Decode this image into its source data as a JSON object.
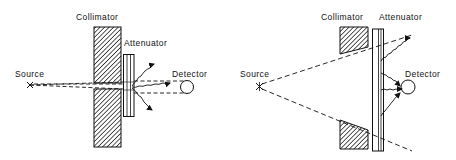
{
  "diagrams": [
    {
      "id": "narrow-beam",
      "labels": {
        "collimator": "Collimator",
        "attenuator": "Attenuator",
        "source": "Source",
        "detector": "Detector"
      }
    },
    {
      "id": "broad-beam",
      "labels": {
        "collimator": "Collimator",
        "attenuator": "Attenuator",
        "source": "Source",
        "detector": "Detector"
      }
    }
  ],
  "colors": {
    "ink": "#111111",
    "background": "#ffffff"
  }
}
